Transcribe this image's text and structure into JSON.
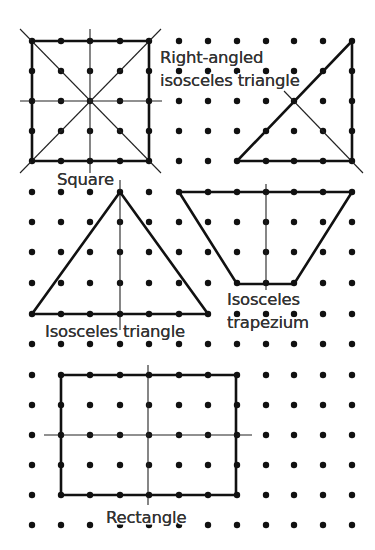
{
  "diagram": {
    "grid": {
      "dot_radius": 3.2,
      "columns_x": [
        32,
        61,
        90,
        120,
        149,
        179,
        208,
        237,
        266,
        294,
        323,
        352
      ],
      "rows_y": [
        41,
        71,
        101,
        131,
        161,
        192,
        222,
        252,
        283,
        314,
        344,
        375,
        405,
        435,
        465,
        495,
        525
      ],
      "skip_regions": [
        {
          "note": "label area",
          "x": [
            179,
            266
          ],
          "y": [
            71,
            71
          ]
        }
      ]
    },
    "shapes": [
      {
        "id": "square",
        "label": "Square",
        "label_pos": [
          57,
          185
        ],
        "polygon": [
          [
            32,
            41
          ],
          [
            149,
            41
          ],
          [
            149,
            161
          ],
          [
            32,
            161
          ]
        ],
        "symmetry_lines": [
          [
            [
              90,
              29
            ],
            [
              90,
              173
            ]
          ],
          [
            [
              20,
              101
            ],
            [
              162,
              101
            ]
          ],
          [
            [
              20,
              29
            ],
            [
              161,
              173
            ]
          ],
          [
            [
              161,
              29
            ],
            [
              20,
              173
            ]
          ]
        ]
      },
      {
        "id": "right-angled-isosceles-triangle",
        "label_lines": [
          "Right-angled",
          "isosceles triangle"
        ],
        "label_pos": [
          160,
          63
        ],
        "label_line_height": 23,
        "polygon": [
          [
            237,
            161
          ],
          [
            352,
            161
          ],
          [
            352,
            41
          ]
        ],
        "symmetry_lines": [
          [
            [
              284,
              91
            ],
            [
              363,
              173
            ]
          ]
        ]
      },
      {
        "id": "isosceles-triangle",
        "label": "Isosceles triangle",
        "label_pos": [
          45,
          337
        ],
        "polygon": [
          [
            120,
            192
          ],
          [
            208,
            314
          ],
          [
            32,
            314
          ]
        ],
        "symmetry_lines": [
          [
            [
              120,
              180
            ],
            [
              120,
              330
            ]
          ]
        ]
      },
      {
        "id": "isosceles-trapezium",
        "label_lines": [
          "Isosceles",
          "trapezium"
        ],
        "label_pos": [
          227,
          305
        ],
        "label_line_height": 23,
        "polygon": [
          [
            179,
            192
          ],
          [
            352,
            192
          ],
          [
            294,
            284
          ],
          [
            237,
            284
          ]
        ],
        "symmetry_lines": [
          [
            [
              266,
              184
            ],
            [
              266,
              290
            ]
          ]
        ]
      },
      {
        "id": "rectangle",
        "label": "Rectangle",
        "label_pos": [
          106,
          523
        ],
        "polygon": [
          [
            61,
            375
          ],
          [
            236,
            375
          ],
          [
            236,
            495
          ],
          [
            61,
            495
          ]
        ],
        "symmetry_lines": [
          [
            [
              148,
              365
            ],
            [
              148,
              505
            ]
          ],
          [
            [
              44,
              435
            ],
            [
              252,
              435
            ]
          ]
        ]
      }
    ]
  }
}
